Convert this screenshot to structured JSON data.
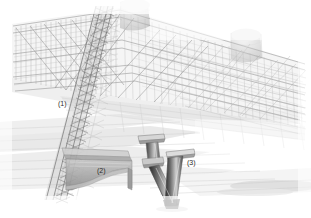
{
  "figure": {
    "background_color": "#ffffff",
    "ink_color": "#707070",
    "label_color": "#2b2b2b",
    "width": 311,
    "height": 218
  },
  "callouts": [
    {
      "id": "1",
      "label": "(1)",
      "x": 58,
      "y": 100,
      "refers_to": "diagonal lattice truss column"
    },
    {
      "id": "2",
      "label": "(2)",
      "x": 97,
      "y": 167,
      "refers_to": "bracket gusset plate"
    },
    {
      "id": "3",
      "label": "(3)",
      "x": 187,
      "y": 159,
      "refers_to": "v-shaped tapered columns"
    }
  ],
  "components": {
    "upper_truss": {
      "name": "upper deck truss girder",
      "tone": "#9a9a9a"
    },
    "lattice_column": {
      "name": "diagonal lattice column",
      "tone": "#6e6e6e"
    },
    "bracket": {
      "name": "cantilever bracket plate",
      "tone": "#8e8e8e"
    },
    "v_columns": {
      "name": "flared v columns",
      "tone": "#555555"
    },
    "domes": {
      "name": "cylindrical dome caps",
      "tone": "#b5b5b5"
    },
    "ground_slabs": {
      "name": "ground slab bands",
      "tone": "#d2d2d2"
    }
  }
}
